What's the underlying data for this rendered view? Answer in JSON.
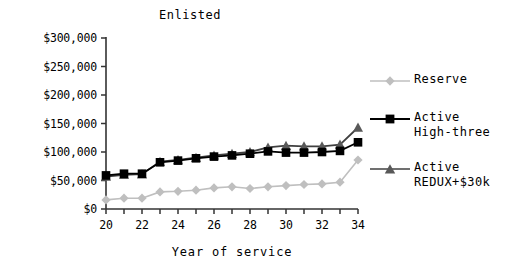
{
  "chart_data": {
    "type": "line",
    "title": "Enlisted",
    "xlabel": "Year of service",
    "ylabel": "",
    "x": [
      20,
      21,
      22,
      23,
      24,
      25,
      26,
      27,
      28,
      29,
      30,
      31,
      32,
      33,
      34
    ],
    "xlim": [
      20,
      34
    ],
    "ylim": [
      0,
      300000
    ],
    "xticks": [
      20,
      21,
      22,
      23,
      24,
      25,
      26,
      27,
      28,
      29,
      30,
      31,
      32,
      33,
      34
    ],
    "xtick_labels": [
      "20",
      "",
      "22",
      "",
      "24",
      "",
      "26",
      "",
      "28",
      "",
      "30",
      "",
      "32",
      "",
      "34"
    ],
    "yticks": [
      0,
      50000,
      100000,
      150000,
      200000,
      250000,
      300000
    ],
    "ytick_labels": [
      "$0",
      "$50,000",
      "$100,000",
      "$150,000",
      "$200,000",
      "$250,000",
      "$300,000"
    ],
    "grid": false,
    "legend_position": "right",
    "series": [
      {
        "name": "Reserve",
        "marker": "diamond",
        "color": "#bfbfbf",
        "values": [
          16000,
          19000,
          19000,
          30000,
          31000,
          33000,
          37000,
          39000,
          36000,
          39000,
          41000,
          43000,
          44000,
          47000,
          86000
        ]
      },
      {
        "name": "Active High-three",
        "marker": "square",
        "color": "#000000",
        "values": [
          59000,
          62000,
          62000,
          82000,
          85000,
          89000,
          92000,
          94000,
          97000,
          101000,
          99000,
          99000,
          100000,
          102000,
          117000
        ]
      },
      {
        "name": "Active REDUX+$30k",
        "marker": "triangle",
        "color": "#595959",
        "values": [
          57000,
          60000,
          61000,
          83000,
          86000,
          90000,
          94000,
          97000,
          100000,
          108000,
          111000,
          110000,
          110000,
          113000,
          143000
        ]
      }
    ]
  },
  "legend": {
    "entries": [
      {
        "label": "Reserve"
      },
      {
        "label": "Active\nHigh-three"
      },
      {
        "label": "Active\nREDUX+$30k"
      }
    ]
  }
}
